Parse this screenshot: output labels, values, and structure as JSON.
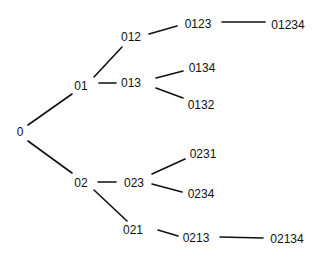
{
  "diagram": {
    "type": "tree",
    "root": "0",
    "nodes": [
      {
        "id": "0",
        "label": "0",
        "x": 20,
        "y": 132
      },
      {
        "id": "01",
        "label": "01",
        "x": 81,
        "y": 86
      },
      {
        "id": "02",
        "label": "02",
        "x": 81,
        "y": 183
      },
      {
        "id": "012",
        "label": "012",
        "x": 131,
        "y": 37
      },
      {
        "id": "013",
        "label": "013",
        "x": 131,
        "y": 83
      },
      {
        "id": "0123",
        "label": "0123",
        "x": 198,
        "y": 24
      },
      {
        "id": "01234",
        "label": "01234",
        "x": 288,
        "y": 25
      },
      {
        "id": "0134",
        "label": "0134",
        "x": 202,
        "y": 68
      },
      {
        "id": "0132",
        "label": "0132",
        "x": 201,
        "y": 105
      },
      {
        "id": "023",
        "label": "023",
        "x": 134,
        "y": 183
      },
      {
        "id": "021",
        "label": "021",
        "x": 133,
        "y": 230
      },
      {
        "id": "0231",
        "label": "0231",
        "x": 203,
        "y": 154
      },
      {
        "id": "0234",
        "label": "0234",
        "x": 201,
        "y": 194
      },
      {
        "id": "0213",
        "label": "0213",
        "x": 196,
        "y": 238
      },
      {
        "id": "02134",
        "label": "02134",
        "x": 287,
        "y": 239
      }
    ],
    "edges": [
      {
        "from": "0",
        "to": "01",
        "x1": 28,
        "y1": 125,
        "x2": 72,
        "y2": 94
      },
      {
        "from": "0",
        "to": "02",
        "x1": 28,
        "y1": 141,
        "x2": 72,
        "y2": 173
      },
      {
        "from": "01",
        "to": "012",
        "x1": 94,
        "y1": 77,
        "x2": 122,
        "y2": 47
      },
      {
        "from": "01",
        "to": "013",
        "x1": 99,
        "y1": 83,
        "x2": 116,
        "y2": 83
      },
      {
        "from": "012",
        "to": "0123",
        "x1": 149,
        "y1": 34,
        "x2": 177,
        "y2": 26
      },
      {
        "from": "0123",
        "to": "01234",
        "x1": 222,
        "y1": 22,
        "x2": 265,
        "y2": 22
      },
      {
        "from": "013",
        "to": "0134",
        "x1": 156,
        "y1": 78,
        "x2": 183,
        "y2": 71
      },
      {
        "from": "013",
        "to": "0132",
        "x1": 156,
        "y1": 88,
        "x2": 183,
        "y2": 98
      },
      {
        "from": "02",
        "to": "023",
        "x1": 98,
        "y1": 182,
        "x2": 116,
        "y2": 182
      },
      {
        "from": "02",
        "to": "021",
        "x1": 94,
        "y1": 190,
        "x2": 127,
        "y2": 221
      },
      {
        "from": "023",
        "to": "0231",
        "x1": 152,
        "y1": 174,
        "x2": 185,
        "y2": 159
      },
      {
        "from": "023",
        "to": "0234",
        "x1": 152,
        "y1": 184,
        "x2": 182,
        "y2": 192
      },
      {
        "from": "021",
        "to": "0213",
        "x1": 158,
        "y1": 230,
        "x2": 178,
        "y2": 236
      },
      {
        "from": "0213",
        "to": "02134",
        "x1": 220,
        "y1": 237,
        "x2": 263,
        "y2": 238
      }
    ]
  }
}
